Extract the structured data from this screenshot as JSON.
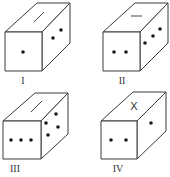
{
  "figure": {
    "dice": [
      {
        "label": "I",
        "top_mark": "line",
        "front_dots": 1,
        "side_dots": 2
      },
      {
        "label": "II",
        "top_mark": "line",
        "front_dots": 2,
        "side_dots": 3
      },
      {
        "label": "III",
        "top_mark": "line",
        "front_dots": 3,
        "side_dots": 4
      },
      {
        "label": "IV",
        "top_mark": "X",
        "front_dots": 2,
        "side_dots": 1
      }
    ]
  },
  "colors": {
    "line": "#3a3a3a",
    "dot": "#1a1a1a",
    "background": "#ffffff"
  }
}
